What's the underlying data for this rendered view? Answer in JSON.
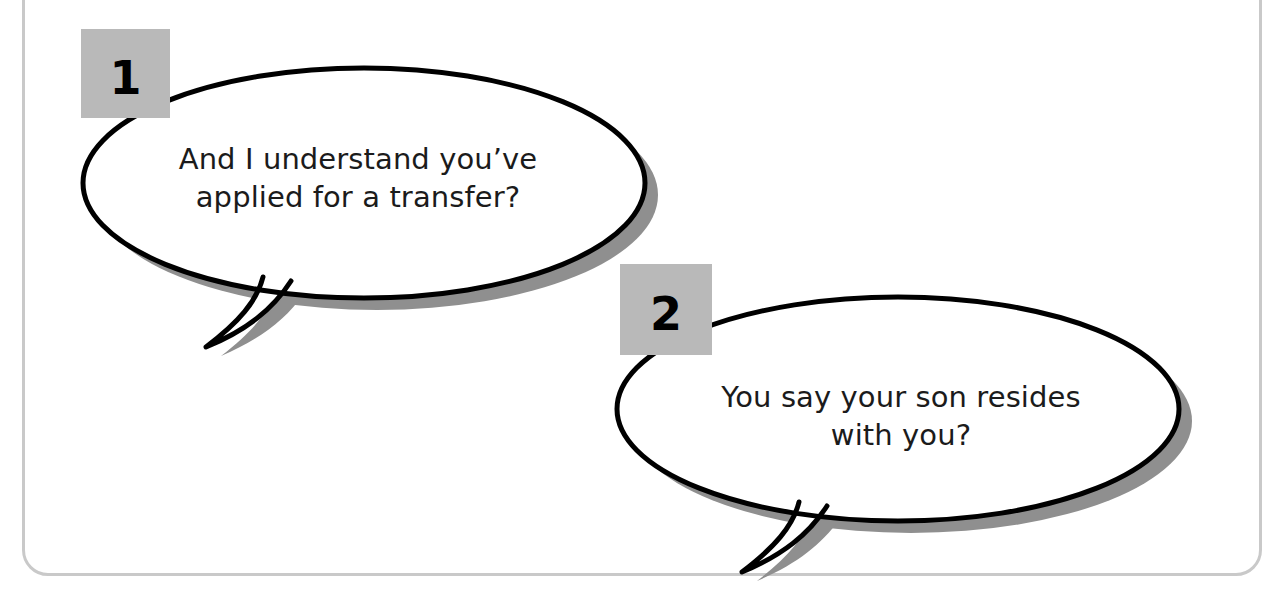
{
  "page": {
    "background_color": "#ffffff",
    "frame_color": "#c9c9c9",
    "badge_color": "#b9b9b9",
    "outline_color": "#000000",
    "shadow_color": "#8f8f8f",
    "text_color": "#1b1b1b"
  },
  "bubbles": [
    {
      "number": "1",
      "text": "And I understand you’ve\napplied for a transfer?",
      "line1": "And I understand you’ve",
      "line2": "applied for a transfer?",
      "tail_direction": "down-left"
    },
    {
      "number": "2",
      "text": "You say your son resides\nwith you?",
      "line1": "You say your son resides",
      "line2": "with you?",
      "tail_direction": "down-left"
    }
  ]
}
